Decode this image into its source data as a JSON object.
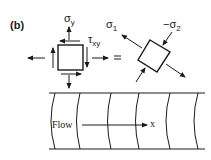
{
  "figure": {
    "panel_label": "(b)",
    "element_left": {
      "sigma_label": "σ",
      "sigma_sub": "y",
      "tau_label": "τ",
      "tau_sub": "xy"
    },
    "equals": "=",
    "element_right": {
      "sigma1_label": "σ",
      "sigma1_sub": "1",
      "sigma2_label": "−σ",
      "sigma2_sub": "2"
    },
    "pipe": {
      "flow_label": "Flow",
      "axis_label": "x"
    },
    "colors": {
      "ink": "#1a1a1a",
      "background": "#ffffff"
    }
  }
}
